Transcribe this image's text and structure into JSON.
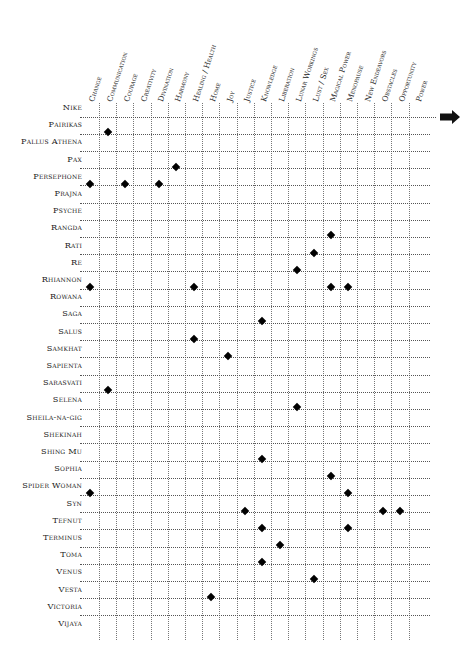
{
  "chart_data": {
    "type": "table",
    "title": "",
    "columns": [
      "Change",
      "Communication",
      "Courage",
      "Creativity",
      "Divination",
      "Harmony",
      "Healing / Health",
      "Home",
      "Joy",
      "Justice",
      "Knowledge",
      "Liberation",
      "Lunar Workings",
      "Lust / Sex",
      "Magical Power",
      "Menopause",
      "New Endeavors",
      "Obstacles",
      "Opportunity",
      "Power"
    ],
    "rows": [
      {
        "name": "Nike",
        "marks": []
      },
      {
        "name": "Pairikas",
        "marks": [
          "Communication"
        ]
      },
      {
        "name": "Pallus Athena",
        "marks": []
      },
      {
        "name": "Pax",
        "marks": [
          "Harmony"
        ]
      },
      {
        "name": "Persephone",
        "marks": [
          "Change",
          "Courage",
          "Divination"
        ]
      },
      {
        "name": "Prajna",
        "marks": []
      },
      {
        "name": "Psyche",
        "marks": []
      },
      {
        "name": "Rangda",
        "marks": [
          "Magical Power"
        ]
      },
      {
        "name": "Rati",
        "marks": [
          "Lust / Sex"
        ]
      },
      {
        "name": "Re",
        "marks": [
          "Lunar Workings"
        ]
      },
      {
        "name": "Rhiannon",
        "marks": [
          "Change",
          "Healing / Health",
          "Magical Power",
          "Menopause"
        ]
      },
      {
        "name": "Rowana",
        "marks": []
      },
      {
        "name": "Saga",
        "marks": [
          "Knowledge"
        ]
      },
      {
        "name": "Salus",
        "marks": [
          "Healing / Health"
        ]
      },
      {
        "name": "Samkhat",
        "marks": [
          "Joy"
        ]
      },
      {
        "name": "Sapienta",
        "marks": []
      },
      {
        "name": "Sarasvati",
        "marks": [
          "Communication"
        ]
      },
      {
        "name": "Selena",
        "marks": [
          "Lunar Workings"
        ]
      },
      {
        "name": "Sheila-na-gig",
        "marks": []
      },
      {
        "name": "Shekinah",
        "marks": []
      },
      {
        "name": "Shing Mu",
        "marks": [
          "Knowledge"
        ]
      },
      {
        "name": "Sophia",
        "marks": [
          "Magical Power"
        ]
      },
      {
        "name": "Spider Woman",
        "marks": [
          "Change",
          "Menopause"
        ]
      },
      {
        "name": "Syn",
        "marks": [
          "Justice",
          "Obstacles",
          "Opportunity"
        ]
      },
      {
        "name": "Tefnut",
        "marks": [
          "Knowledge",
          "Menopause"
        ]
      },
      {
        "name": "Terminus",
        "marks": [
          "Liberation"
        ]
      },
      {
        "name": "Toma",
        "marks": [
          "Knowledge"
        ]
      },
      {
        "name": "Venus",
        "marks": [
          "Lust / Sex"
        ]
      },
      {
        "name": "Vesta",
        "marks": [
          "Home"
        ]
      },
      {
        "name": "Victoria",
        "marks": []
      },
      {
        "name": "Vijaya",
        "marks": []
      }
    ],
    "marker": "diamond",
    "continuation_arrow": "right-arrow-icon",
    "grid": "dotted"
  },
  "layout": {
    "first_line_x": 99,
    "col_spacing": 17.2,
    "first_row_y": 107,
    "row_spacing": 17.2,
    "grid_top": 103,
    "grid_bottom": 640,
    "grid_left": 80,
    "grid_right": 430,
    "first_line_right": 436
  },
  "colors": {
    "marker": "#000000",
    "grid": "#555555",
    "text": "#222222"
  }
}
